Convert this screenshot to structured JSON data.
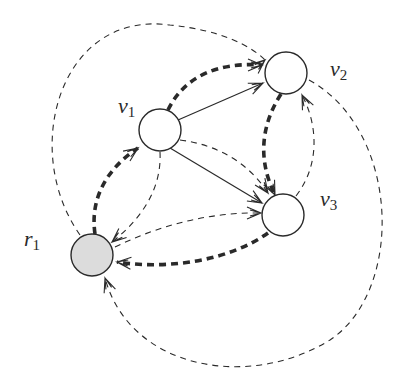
{
  "diagram": {
    "type": "directed-graph",
    "nodes": [
      {
        "id": "r1",
        "label": "r",
        "subscript": "1",
        "x": 92,
        "y": 255,
        "r": 21,
        "fill": "#dcdcdc",
        "label_x": 24,
        "label_y": 228
      },
      {
        "id": "v1",
        "label": "v",
        "subscript": "1",
        "x": 160,
        "y": 130,
        "r": 21,
        "fill": "#ffffff",
        "label_x": 118,
        "label_y": 95
      },
      {
        "id": "v2",
        "label": "v",
        "subscript": "2",
        "x": 286,
        "y": 73,
        "r": 21,
        "fill": "#ffffff",
        "label_x": 330,
        "label_y": 58
      },
      {
        "id": "v3",
        "label": "v",
        "subscript": "3",
        "x": 283,
        "y": 215,
        "r": 21,
        "fill": "#ffffff",
        "label_x": 320,
        "label_y": 188
      }
    ],
    "edges": [
      {
        "from": "r1",
        "to": "v2",
        "style": "dashed-thin",
        "path": "M 80 235 C 20 150, 60 10, 170 25 C 220 30, 250 45, 265 60",
        "arrow": [
          265,
          60,
          -40
        ]
      },
      {
        "from": "v2",
        "to": "r1",
        "style": "dashed-thin",
        "path": "M 309 80 C 400 130, 405 290, 330 340 C 250 390, 130 370, 105 278",
        "arrow": [
          105,
          278,
          250
        ]
      },
      {
        "from": "r1",
        "to": "v1",
        "style": "dashed-thick",
        "path": "M 95 234 C 90 200, 105 170, 138 148",
        "arrow": [
          138,
          148,
          -35
        ]
      },
      {
        "from": "v1",
        "to": "v2",
        "style": "dashed-thick",
        "path": "M 168 110 C 185 75, 220 62, 262 65",
        "arrow": [
          262,
          65,
          0
        ]
      },
      {
        "from": "v1",
        "to": "v2",
        "style": "solid",
        "path": "M 178 120 L 263 83",
        "arrow": [
          263,
          83,
          -24
        ]
      },
      {
        "from": "v1",
        "to": "v3",
        "style": "solid",
        "path": "M 170 148 L 262 203",
        "arrow": [
          262,
          203,
          31
        ]
      },
      {
        "from": "v1",
        "to": "v3",
        "style": "dashed-thin",
        "path": "M 180 140 C 220 145, 250 165, 268 193",
        "arrow": [
          268,
          193,
          55
        ]
      },
      {
        "from": "v2",
        "to": "v3",
        "style": "dashed-thick",
        "path": "M 281 94 C 258 130, 260 165, 275 195",
        "arrow": [
          275,
          195,
          65
        ]
      },
      {
        "from": "v3",
        "to": "v2",
        "style": "dashed-thin",
        "path": "M 296 196 C 320 165, 318 125, 302 95",
        "arrow": [
          302,
          95,
          -115
        ]
      },
      {
        "from": "v1",
        "to": "r1",
        "style": "dashed-thin",
        "path": "M 160 152 C 162 190, 140 220, 112 242",
        "arrow": [
          112,
          242,
          140
        ]
      },
      {
        "from": "r1",
        "to": "v3",
        "style": "dashed-thin",
        "path": "M 115 247 C 160 225, 210 212, 261 213",
        "arrow": [
          261,
          213,
          0
        ]
      },
      {
        "from": "v3",
        "to": "r1",
        "style": "dashed-thick",
        "path": "M 268 233 C 230 260, 170 270, 117 262",
        "arrow": [
          117,
          262,
          185
        ]
      }
    ],
    "colors": {
      "stroke": "#2a2a2a",
      "shaded_node": "#dcdcdc",
      "background": "#ffffff"
    }
  }
}
